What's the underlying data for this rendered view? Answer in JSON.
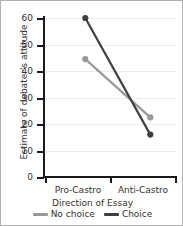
{
  "chart_data": {
    "type": "line",
    "title": "",
    "xlabel": "Direction of Essay",
    "ylabel": "Estimate of debater's attitude",
    "categories": [
      "Pro-Castro",
      "Anti-Castro"
    ],
    "series": [
      {
        "name": "No choice",
        "values": [
          44.5,
          22.5
        ],
        "color": "#999999"
      },
      {
        "name": "Choice",
        "values": [
          60,
          16
        ],
        "color": "#404040"
      }
    ],
    "ylim": [
      0,
      60
    ],
    "yticks": [
      0,
      10,
      20,
      30,
      40,
      50,
      60
    ],
    "ytick_labels": [
      "0",
      "10",
      "20",
      "30",
      "40",
      "50",
      "60"
    ],
    "grid": true,
    "legend_position": "bottom",
    "markers": true
  },
  "axes": {
    "y_title": "Estimate of debater's attitude",
    "x_title": "Direction of Essay",
    "y_labels": [
      "60",
      "50",
      "40",
      "30",
      "20",
      "10",
      "0"
    ],
    "x_labels": [
      "Pro-Castro",
      "Anti-Castro"
    ]
  },
  "legend": {
    "entries": [
      {
        "label": "No choice",
        "color": "#999999"
      },
      {
        "label": "Choice",
        "color": "#404040"
      }
    ]
  },
  "style": {
    "border_color": "#b0b0b0",
    "axis_color": "#1a1a1a",
    "grid_color": "#ececec",
    "background": "#ffffff",
    "text_color": "#333333"
  }
}
